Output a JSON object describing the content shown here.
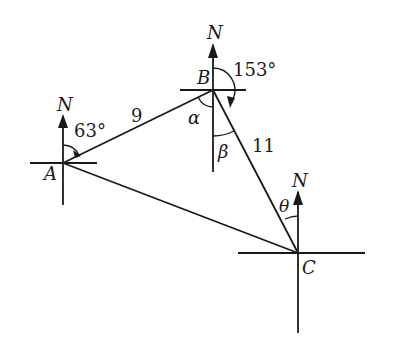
{
  "diagram": {
    "type": "bearing-triangle",
    "points": {
      "A": {
        "label": "A",
        "x": 63,
        "y": 163
      },
      "B": {
        "label": "B",
        "x": 213,
        "y": 90
      },
      "C": {
        "label": "C",
        "x": 298,
        "y": 253
      }
    },
    "north_label": "N",
    "sides": {
      "AB": {
        "label": "9"
      },
      "BC": {
        "label": "11"
      }
    },
    "angles": {
      "bearing_A": {
        "label": "63°"
      },
      "bearing_B": {
        "label": "153°"
      },
      "alpha": {
        "label": "α"
      },
      "beta": {
        "label": "β"
      },
      "theta": {
        "label": "θ"
      }
    },
    "colors": {
      "ink": "#1a1a1a",
      "background": "#ffffff"
    }
  }
}
